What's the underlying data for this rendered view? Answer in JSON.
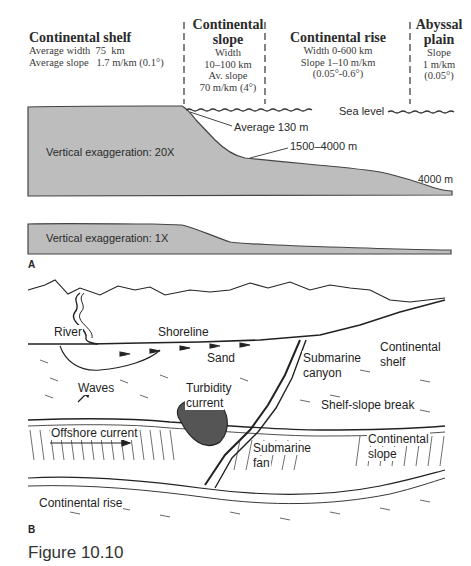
{
  "panel_a": {
    "headers": [
      {
        "title": "Continental shelf",
        "lines": [
          "Average width  75  km",
          "Average slope   1.7 m/km (0.1°)"
        ]
      },
      {
        "title_lines": [
          "Continental",
          "slope"
        ],
        "lines": [
          "Width",
          "10–100 km",
          "Av. slope",
          "70 m/km (4°)"
        ]
      },
      {
        "title": "Continental rise",
        "lines": [
          "Width 0-600 km",
          "Slope 1–10 m/km",
          "(0.05°-0.6°)"
        ]
      },
      {
        "title_lines": [
          "Abyssal",
          "plain"
        ],
        "lines": [
          "Slope",
          "1 m/km",
          "(0.05°)"
        ]
      }
    ],
    "profile_20x": {
      "exaggeration_label": "Vertical exaggeration: 20X",
      "sea_level_label": "Sea level",
      "shelf_break_depth_label": "Average 130 m",
      "slope_base_depth_label": "1500–4000 m",
      "abyssal_depth_label": "4000 m"
    },
    "profile_1x": {
      "exaggeration_label": "Vertical exaggeration: 1X"
    },
    "panel_letter": "A"
  },
  "panel_b": {
    "labels": {
      "river": "River",
      "shoreline": "Shoreline",
      "sand": "Sand",
      "waves": "Waves",
      "turbidity_current_1": "Turbidity",
      "turbidity_current_2": "current",
      "submarine_canyon_1": "Submarine",
      "submarine_canyon_2": "canyon",
      "continental_shelf_1": "Continental",
      "continental_shelf_2": "shelf",
      "shelf_slope_break": "Shelf-slope break",
      "offshore_current": "Offshore current",
      "submarine_fan_1": "Submarine",
      "submarine_fan_2": "fan",
      "continental_slope_1": "Continental",
      "continental_slope_2": "slope",
      "continental_rise": "Continental rise"
    },
    "panel_letter": "B"
  },
  "caption": "Figure 10.10",
  "colors": {
    "profile_fill": "#bdbdbd",
    "profile_stroke": "#444444",
    "ink": "#222222"
  }
}
